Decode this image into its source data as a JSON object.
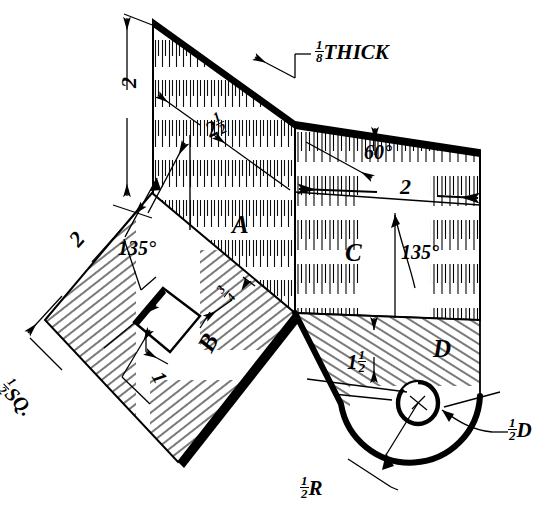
{
  "drawing": {
    "type": "isometric-sheet-metal-development",
    "description": "Isometric pictorial of a bent sheet-metal part with four panels A, B, C and D",
    "stock_note": "1/8 THICK",
    "panel_labels": [
      "A",
      "B",
      "C",
      "D"
    ],
    "line_color": "#000000",
    "background": "#ffffff"
  },
  "annotations": {
    "thick": {
      "whole": "",
      "num": "1",
      "den": "8",
      "suffix": " THICK"
    },
    "height_2": {
      "text": "2"
    },
    "diag_2half": {
      "whole": "2",
      "num": "1",
      "den": "2",
      "suffix": ""
    },
    "angle_60": {
      "text": "60°"
    },
    "width_2_top": {
      "text": "2"
    },
    "angle_135_right": {
      "text": "135°"
    },
    "angle_135_left": {
      "text": "135°"
    },
    "left_2": {
      "text": "2"
    },
    "depth_1half": {
      "whole": "1",
      "num": "1",
      "den": "2",
      "suffix": ""
    },
    "hole_dia": {
      "whole": "",
      "num": "1",
      "den": "2",
      "suffix": "D"
    },
    "corner_radius": {
      "whole": "",
      "num": "1",
      "den": "2",
      "suffix": "R"
    },
    "square_hole": {
      "whole": "",
      "num": "1",
      "den": "2",
      "suffix": " SQ."
    },
    "edge_three_quarter": {
      "whole": "",
      "num": "3",
      "den": "4",
      "suffix": ""
    },
    "edge_one": {
      "text": "1"
    },
    "label_A": {
      "text": "A"
    },
    "label_B": {
      "text": "B"
    },
    "label_C": {
      "text": "C"
    },
    "label_D": {
      "text": "D"
    }
  }
}
